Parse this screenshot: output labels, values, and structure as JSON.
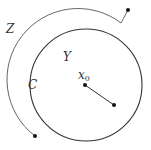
{
  "diagram": {
    "labels": {
      "z": "Z",
      "y": "Y",
      "c": "C",
      "x0_base": "x",
      "x0_sub": "0"
    },
    "colors": {
      "stroke": "#333333",
      "arc": "#555555",
      "dot": "#111111"
    },
    "circle": {
      "cx": 86,
      "cy": 85,
      "r": 56
    },
    "outer_arc": {
      "start": [
        121,
        23
      ],
      "end": [
        35,
        136
      ],
      "radius": 71,
      "tail_end": [
        128,
        10
      ]
    },
    "segment": {
      "from": [
        85,
        85
      ],
      "to": [
        114,
        105
      ]
    }
  }
}
